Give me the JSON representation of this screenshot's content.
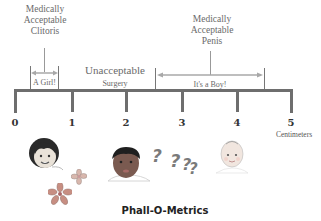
{
  "diagram": {
    "title": "Phall-O-Metrics",
    "unit_label": "Centimeters",
    "scale": {
      "min": 0,
      "max": 5,
      "ticks": [
        "0",
        "1",
        "2",
        "3",
        "4",
        "5"
      ]
    },
    "zones": [
      {
        "name": "clitoris",
        "heading": [
          "Medically",
          "Acceptable",
          "Clitoris"
        ],
        "range_label": "A Girl!",
        "range": [
          0.3,
          0.9
        ]
      },
      {
        "name": "unacceptable",
        "heading": [
          "Unacceptable"
        ],
        "range_label": "Surgery",
        "range": [
          0.9,
          2.5
        ]
      },
      {
        "name": "penis",
        "heading": [
          "Medically",
          "Acceptable",
          "Penis"
        ],
        "range_label": "It's a Boy!",
        "range": [
          2.5,
          4.5
        ]
      }
    ],
    "illustrations": {
      "girl": "girl-face-icon",
      "flowers": "flower-icon",
      "intersex_child": "child-face-icon",
      "question_marks": [
        "?",
        "?",
        "?",
        "?"
      ],
      "baby_boy": "baby-face-icon"
    },
    "colors": {
      "ruler": "#6e6e6e",
      "arrow": "#a8a8a8",
      "text": "#6a6a6a"
    }
  }
}
